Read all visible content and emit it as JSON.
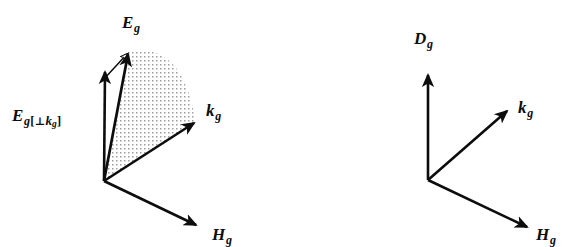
{
  "figure": {
    "kind": "vector-diagram",
    "background_color": "#ffffff",
    "ink_color": "#0d0d0d",
    "stipple_color": "#9a9a9a",
    "panels": [
      {
        "name": "left-panel",
        "origin": [
          104,
          181
        ],
        "vectors": [
          {
            "id": "E_g",
            "label_text": "E",
            "label_sub": "g",
            "tip": [
              128,
              52
            ],
            "style": "solid-thick",
            "label_pos": [
              122,
              14
            ]
          },
          {
            "id": "E_g_perp_k_g",
            "label_text": "E",
            "label_sub": "g",
            "label_bracket_open": "[",
            "label_perp": "⊥",
            "label_inner": "k",
            "label_inner_sub": "g",
            "label_bracket_close": "]",
            "tip": [
              105,
              70
            ],
            "style": "solid-thick",
            "label_pos": [
              12,
              107
            ]
          },
          {
            "id": "E_g_component_outline",
            "label_text": "",
            "tail": [
              105,
              78
            ],
            "tip": [
              129,
              53
            ],
            "style": "thin-outline",
            "label_pos": null
          },
          {
            "id": "k_g",
            "label_text": "k",
            "label_sub": "g",
            "tip": [
              195,
              122
            ],
            "style": "solid-thick",
            "label_pos": [
              206,
              102
            ]
          },
          {
            "id": "H_g",
            "label_text": "H",
            "label_sub": "g",
            "tip": [
              197,
              226
            ],
            "style": "solid-thick",
            "label_pos": [
              212,
              226
            ]
          }
        ],
        "shaded_region": {
          "name": "stipple-sector",
          "description": "dotted fan between E_g and k_g with curved outer arc"
        }
      },
      {
        "name": "right-panel",
        "origin": [
          428,
          180
        ],
        "vectors": [
          {
            "id": "D_g",
            "label_text": "D",
            "label_sub": "g",
            "tip": [
              428,
              73
            ],
            "style": "solid-thick",
            "label_pos": [
              414,
              30
            ]
          },
          {
            "id": "k_g",
            "label_text": "k",
            "label_sub": "g",
            "tip": [
              508,
              110
            ],
            "style": "solid-thick",
            "label_pos": [
              518,
              99
            ]
          },
          {
            "id": "H_g",
            "label_text": "H",
            "label_sub": "g",
            "tip": [
              528,
              228
            ],
            "style": "solid-thick",
            "label_pos": [
              536,
              226
            ]
          }
        ],
        "shaded_region": null
      }
    ]
  },
  "labels": {
    "eg": {
      "base": "E",
      "sub": "g"
    },
    "eg_perp": {
      "base": "E",
      "sub": "g",
      "open": "[",
      "perp": "⊥",
      "inner": "k",
      "inner_sub": "g",
      "close": "]"
    },
    "kg_left": {
      "base": "k",
      "sub": "g"
    },
    "hg_left": {
      "base": "H",
      "sub": "g"
    },
    "dg": {
      "base": "D",
      "sub": "g"
    },
    "kg_right": {
      "base": "k",
      "sub": "g"
    },
    "hg_right": {
      "base": "H",
      "sub": "g"
    }
  }
}
